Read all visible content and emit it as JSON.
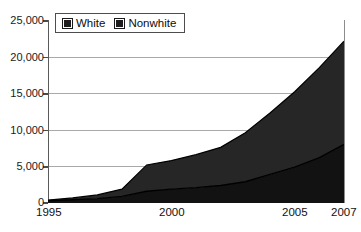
{
  "chart_data": {
    "type": "area",
    "stacked": true,
    "title": "",
    "subtitle": "",
    "xlabel": "",
    "ylabel": "",
    "x": [
      1995,
      1996,
      1997,
      1998,
      1999,
      2000,
      2001,
      2002,
      2003,
      2004,
      2005,
      2006,
      2007
    ],
    "xtick_labels": [
      "1995",
      "2000",
      "2005",
      "2007"
    ],
    "xtick_values": [
      1995,
      2000,
      2005,
      2007
    ],
    "xlim": [
      1995,
      2007
    ],
    "ylim": [
      0,
      25000
    ],
    "ytick_labels": [
      "0",
      "5,000",
      "10,000",
      "15,000",
      "20,000",
      "25,000"
    ],
    "ytick_values": [
      0,
      5000,
      10000,
      15000,
      20000,
      25000
    ],
    "grid": true,
    "grid_axis": "y",
    "legend_position": "top-left",
    "series": [
      {
        "name": "White",
        "color": "#1d1d1d",
        "values": [
          300,
          450,
          600,
          900,
          1600,
          1900,
          2100,
          2400,
          2900,
          3900,
          4900,
          6200,
          8000
        ]
      },
      {
        "name": "Nonwhite",
        "color": "#262626",
        "values": [
          100,
          250,
          500,
          1000,
          3600,
          3900,
          4500,
          5200,
          6700,
          8400,
          10300,
          12300,
          14100
        ]
      }
    ],
    "cumulative_totals": [
      400,
      700,
      1100,
      1900,
      5200,
      5800,
      6600,
      7600,
      9600,
      12300,
      15200,
      18500,
      22100
    ]
  },
  "legend": {
    "items": [
      {
        "label": "White",
        "swatch": "black-square-swatch"
      },
      {
        "label": "Nonwhite",
        "swatch": "black-square-swatch"
      }
    ]
  },
  "axes": {
    "y_labels": [
      "25,000",
      "20,000",
      "15,000",
      "10,000",
      "5,000",
      "0"
    ],
    "x_labels": [
      "1995",
      "2000",
      "2005",
      "2007"
    ]
  }
}
